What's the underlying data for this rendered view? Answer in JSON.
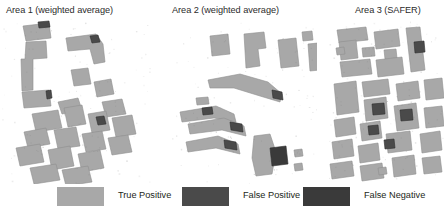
{
  "figure": {
    "background": "#ffffff",
    "panels": [
      {
        "id": "area-1",
        "title": "Area 1 (weighted average)"
      },
      {
        "id": "area-2",
        "title": "Area 2 (weighted average)"
      },
      {
        "id": "area-3",
        "title": "Area 3 (SAFER)"
      }
    ]
  },
  "legend": {
    "items": [
      {
        "label": "True Positive",
        "color": "#a8a8a8"
      },
      {
        "label": "False Positive",
        "color": "#4a4a4a"
      },
      {
        "label": "False Negative",
        "color": "#3a3a3a"
      }
    ]
  },
  "colors": {
    "true_positive": "#a8a8a8",
    "false_positive": "#4a4a4a",
    "false_negative": "#3a3a3a",
    "background": "#ffffff",
    "text": "#231f20",
    "speckle": "#d9d9d9"
  },
  "chart_data": {
    "type": "map",
    "classes": [
      "True Positive",
      "False Positive",
      "False Negative"
    ],
    "class_colors": [
      "#a8a8a8",
      "#4a4a4a",
      "#3a3a3a"
    ],
    "panels": [
      {
        "name": "Area 1 (weighted average)",
        "viewbox": "0 0 150 166",
        "description": "Dense urban block cluster, diagonal street grid, mostly true-positive footprints with small dark false-positive patches",
        "shapes": [
          {
            "class": "true_positive",
            "points": "21,8 47,5 49,20 24,23"
          },
          {
            "class": "false_positive",
            "points": "36,4 47,3 48,9 37,10"
          },
          {
            "class": "true_positive",
            "points": "24,24 44,23 45,40 31,41 31,72 20,73 19,41 23,41"
          },
          {
            "class": "true_positive",
            "points": "20,74 47,72 49,88 22,90"
          },
          {
            "class": "false_positive",
            "points": "44,73 49,72 50,80 45,81"
          },
          {
            "class": "true_positive",
            "points": "64,20 94,16 101,26 103,44 92,46 88,31 66,33"
          },
          {
            "class": "false_positive",
            "points": "88,18 96,17 98,24 90,25"
          },
          {
            "class": "true_positive",
            "points": "69,52 86,50 89,66 72,68"
          },
          {
            "class": "true_positive",
            "points": "92,64 109,61 112,76 95,79"
          },
          {
            "class": "true_positive",
            "points": "56,84 76,80 80,92 60,96"
          },
          {
            "class": "true_positive",
            "points": "100,84 120,81 124,96 104,99"
          },
          {
            "class": "true_positive",
            "points": "30,96 56,92 60,110 34,114"
          },
          {
            "class": "true_positive",
            "points": "62,90 80,87 84,106 66,109"
          },
          {
            "class": "true_positive",
            "points": "86,96 104,93 108,112 90,115"
          },
          {
            "class": "false_positive",
            "points": "94,99 102,98 104,106 96,107"
          },
          {
            "class": "true_positive",
            "points": "110,100 130,97 134,116 114,119"
          },
          {
            "class": "true_positive",
            "points": "22,114 44,110 48,126 26,130"
          },
          {
            "class": "true_positive",
            "points": "52,112 74,109 78,128 56,131"
          },
          {
            "class": "true_positive",
            "points": "80,116 100,113 104,131 84,134"
          },
          {
            "class": "true_positive",
            "points": "106,120 126,117 130,134 110,137"
          },
          {
            "class": "true_positive",
            "points": "14,130 38,126 42,144 18,148"
          },
          {
            "class": "true_positive",
            "points": "46,132 68,128 72,148 50,152"
          },
          {
            "class": "true_positive",
            "points": "76,136 98,132 102,150 80,154"
          },
          {
            "class": "true_positive",
            "points": "28,150 54,146 58,162 32,166"
          },
          {
            "class": "true_positive",
            "points": "60,152 86,148 90,164 64,168"
          }
        ]
      },
      {
        "name": "Area 2 (weighted average)",
        "viewbox": "0 0 145 166",
        "description": "Sparse scattered footprints with elongated diagonal ridge shapes and dark false-positive blobs",
        "shapes": [
          {
            "class": "true_positive",
            "points": "38,18 56,16 58,36 40,38"
          },
          {
            "class": "true_positive",
            "points": "72,16 92,14 94,30 86,31 88,48 74,50"
          },
          {
            "class": "true_positive",
            "points": "106,22 124,20 127,48 109,50"
          },
          {
            "class": "true_positive",
            "points": "130,14 140,13 141,22 131,23"
          },
          {
            "class": "true_positive",
            "points": "136,26 146,25 148,52 138,53"
          },
          {
            "class": "true_positive",
            "points": "36,62 68,56 96,64 110,76 108,84 88,78 62,70 38,70"
          },
          {
            "class": "false_positive",
            "points": "100,72 110,74 111,82 101,80"
          },
          {
            "class": "true_positive",
            "points": "24,80 36,79 37,86 25,87"
          },
          {
            "class": "true_positive",
            "points": "8,94 44,88 62,96 64,104 42,100 10,104"
          },
          {
            "class": "false_positive",
            "points": "30,90 40,89 41,96 31,97"
          },
          {
            "class": "true_positive",
            "points": "16,106 52,100 72,108 74,118 50,112 18,116"
          },
          {
            "class": "false_positive",
            "points": "58,104 70,106 71,114 59,112"
          },
          {
            "class": "true_positive",
            "points": "14,124 46,118 66,126 68,136 44,130 16,134"
          },
          {
            "class": "false_positive",
            "points": "52,122 64,124 65,132 53,130"
          },
          {
            "class": "true_positive",
            "points": "82,118 98,116 104,134 100,156 84,158 80,140"
          },
          {
            "class": "false_negative",
            "points": "98,130 114,128 116,146 100,148"
          },
          {
            "class": "true_positive",
            "points": "122,132 130,131 131,138 123,139"
          },
          {
            "class": "true_positive",
            "points": "122,146 130,145 131,152 123,153"
          }
        ]
      },
      {
        "name": "Area 3 (SAFER)",
        "viewbox": "0 0 118 166",
        "description": "Regular rectangular grid of building footprints in rows and columns with scattered dark false-positive cells",
        "shapes": [
          {
            "class": "true_positive",
            "points": "11,12 40,9 42,22 13,25"
          },
          {
            "class": "true_positive",
            "points": "13,24 30,22 32,40 15,42"
          },
          {
            "class": "true_positive",
            "points": "48,14 72,11 74,28 50,31"
          },
          {
            "class": "true_positive",
            "points": "80,10 94,9 99,52 85,54"
          },
          {
            "class": "false_positive",
            "points": "88,24 98,23 99,34 89,35"
          },
          {
            "class": "true_positive",
            "points": "10,30 18,29 19,36 11,37"
          },
          {
            "class": "true_positive",
            "points": "36,30 48,29 49,38 37,39"
          },
          {
            "class": "true_positive",
            "points": "58,32 70,31 71,40 59,41"
          },
          {
            "class": "true_positive",
            "points": "14,44 44,41 46,56 16,59"
          },
          {
            "class": "true_positive",
            "points": "50,42 76,39 78,56 52,59"
          },
          {
            "class": "true_positive",
            "points": "8,66 30,63 33,94 11,97"
          },
          {
            "class": "true_positive",
            "points": "36,64 62,61 64,76 38,79"
          },
          {
            "class": "true_positive",
            "points": "70,66 92,63 94,80 72,83"
          },
          {
            "class": "true_positive",
            "points": "98,62 116,60 118,80 100,82"
          },
          {
            "class": "true_positive",
            "points": "38,82 60,79 62,100 40,103"
          },
          {
            "class": "false_positive",
            "points": "46,86 58,85 59,96 47,97"
          },
          {
            "class": "true_positive",
            "points": "68,88 90,85 93,110 71,113"
          },
          {
            "class": "false_positive",
            "points": "74,92 86,91 87,102 75,103"
          },
          {
            "class": "true_positive",
            "points": "98,90 116,88 118,108 100,110"
          },
          {
            "class": "true_positive",
            "points": "8,102 28,99 30,116 10,119"
          },
          {
            "class": "true_positive",
            "points": "34,106 54,103 56,120 36,123"
          },
          {
            "class": "false_positive",
            "points": "42,108 52,107 53,116 43,117"
          },
          {
            "class": "true_positive",
            "points": "60,116 84,113 86,132 62,135"
          },
          {
            "class": "true_positive",
            "points": "94,116 114,113 116,132 96,135"
          },
          {
            "class": "true_positive",
            "points": "6,124 26,121 28,138 8,141"
          },
          {
            "class": "true_positive",
            "points": "32,128 52,125 54,142 34,145"
          },
          {
            "class": "true_positive",
            "points": "4,146 26,143 28,158 6,161"
          },
          {
            "class": "true_positive",
            "points": "34,148 56,145 58,160 36,163"
          },
          {
            "class": "true_positive",
            "points": "66,140 88,137 90,156 68,159"
          },
          {
            "class": "true_positive",
            "points": "96,140 114,138 116,154 98,156"
          },
          {
            "class": "false_positive",
            "points": "58,122 68,121 69,130 59,131"
          },
          {
            "class": "true_positive",
            "points": "52,150 60,149 61,156 53,157"
          }
        ]
      }
    ]
  }
}
